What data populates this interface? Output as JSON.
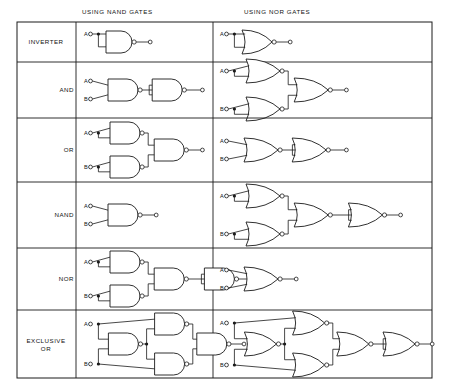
{
  "figure": {
    "title_columns": [
      {
        "id": "nand",
        "label": "USING NAND GATES"
      },
      {
        "id": "nor",
        "label": "USING NOR GATES"
      }
    ],
    "input_labels": {
      "a": "A",
      "b": "B"
    },
    "colors": {
      "ink": "#1a1a1a",
      "paper": "#ffffff"
    },
    "frame": {
      "x": 17,
      "y": 22,
      "w": 415,
      "h": 356,
      "label_col_right": 76,
      "mid_col_x": 213
    },
    "rows": [
      {
        "id": "inverter",
        "label": "INVERTER",
        "align": "center",
        "y_top": 22,
        "y_bottom": 62,
        "nand_gate_count": 1,
        "nor_gate_count": 1,
        "nand_desc": "single NAND with both inputs tied to A",
        "nor_desc": "single NOR with both inputs tied to A"
      },
      {
        "id": "and",
        "label": "AND",
        "align": "right",
        "y_top": 62,
        "y_bottom": 118,
        "nand_gate_count": 2,
        "nor_gate_count": 3,
        "nand_desc": "NAND of A,B followed by NAND inverter",
        "nor_desc": "NOR inverters on A and B feeding a NOR"
      },
      {
        "id": "or",
        "label": "OR",
        "align": "right",
        "y_top": 118,
        "y_bottom": 182,
        "nand_gate_count": 3,
        "nor_gate_count": 2,
        "nand_desc": "NAND inverters on A and B feeding a NAND",
        "nor_desc": "NOR of A,B followed by NOR inverter"
      },
      {
        "id": "nand",
        "label": "NAND",
        "align": "right",
        "y_top": 182,
        "y_bottom": 248,
        "nand_gate_count": 1,
        "nor_gate_count": 4,
        "nand_desc": "single NAND gate",
        "nor_desc": "NOR inverters on A and B, then NOR, then NOR inverter"
      },
      {
        "id": "nor",
        "label": "NOR",
        "align": "right",
        "y_top": 248,
        "y_bottom": 310,
        "nand_gate_count": 4,
        "nor_gate_count": 1,
        "nand_desc": "NAND inverters on A and B, then NAND, then NAND inverter",
        "nor_desc": "single NOR gate"
      },
      {
        "id": "exclusive-or",
        "label": "EXCLUSIVE\nOR",
        "align": "center",
        "y_top": 310,
        "y_bottom": 378,
        "nand_gate_count": 4,
        "nor_gate_count": 5,
        "nand_desc": "four NAND gates in classic exclusive-OR arrangement",
        "nor_desc": "five NOR gates in exclusive-OR arrangement"
      }
    ]
  }
}
